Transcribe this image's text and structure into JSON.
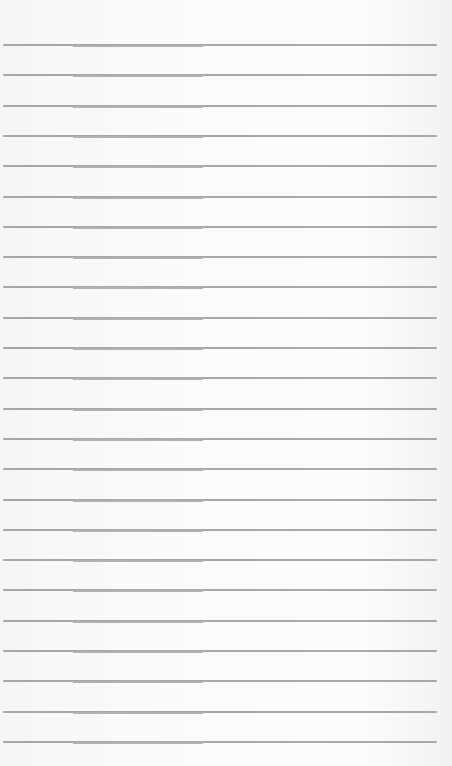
{
  "paper": {
    "background": "#fafafa",
    "rule_color": "#9a9a9a",
    "rule_count": 24,
    "first_rule_y": 44,
    "rule_spacing": 30.3,
    "rule_left": 3,
    "rule_width": 434
  }
}
